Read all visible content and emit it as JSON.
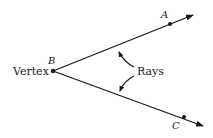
{
  "diagram": {
    "labels": {
      "vertex_word": "Vertex",
      "point_b": "B",
      "point_a": "A",
      "point_c": "C",
      "rays_word": "Rays"
    },
    "points": {
      "B": [
        53,
        71
      ],
      "A": [
        170,
        24
      ],
      "C": [
        184,
        117
      ]
    },
    "colors": {
      "stroke": "#1a1a1a",
      "background": "#ffffff"
    }
  }
}
